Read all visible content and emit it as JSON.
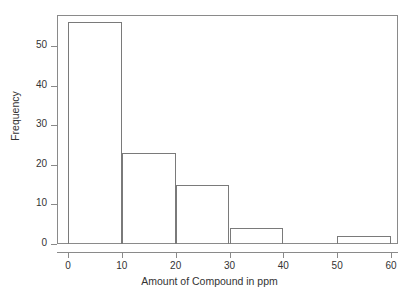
{
  "chart_data": {
    "type": "bar",
    "title": "",
    "subtitle": "",
    "xlabel": "Amount of Compound in ppm",
    "ylabel": "Frequency",
    "categories": [
      "0-10",
      "10-20",
      "20-30",
      "30-40",
      "40-50",
      "50-60"
    ],
    "bin_edges": [
      0,
      10,
      20,
      30,
      40,
      50,
      60
    ],
    "values": [
      56,
      23,
      15,
      4,
      0,
      2
    ],
    "xlim": [
      0,
      60
    ],
    "ylim": [
      0,
      57
    ],
    "x_ticks": [
      "0",
      "10",
      "20",
      "30",
      "40",
      "50",
      "60"
    ],
    "x_tick_values": [
      0,
      10,
      20,
      30,
      40,
      50,
      60
    ],
    "y_ticks": [
      "0",
      "10",
      "20",
      "30",
      "40",
      "50"
    ],
    "y_tick_values": [
      0,
      10,
      20,
      30,
      40,
      50
    ],
    "grid": false,
    "legend": false,
    "legend_position": "none",
    "bar_edge_color": "#7a7a7a",
    "bar_fill_color": "#ffffff",
    "axis_color": "#8a8a8a",
    "text_color": "#333333",
    "background_color": "#ffffff"
  }
}
